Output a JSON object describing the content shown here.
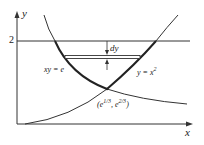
{
  "figure": {
    "axes": {
      "x_label": "x",
      "y_label": "y",
      "y_tick_label": "2"
    },
    "curves": [
      {
        "name": "hyperbola",
        "equation": "xy = e"
      },
      {
        "name": "parabola",
        "equation_base": "y = x",
        "exponent": "2"
      }
    ],
    "horizontal_line": {
      "y_value": "2"
    },
    "strip": {
      "label": "dy"
    },
    "intersection": {
      "prefix": "(e",
      "x_exp": "1/3",
      "middle": ", e",
      "y_exp": "2/3",
      "suffix": ")"
    },
    "colors": {
      "ink": "#222222",
      "background": "#ffffff"
    }
  }
}
